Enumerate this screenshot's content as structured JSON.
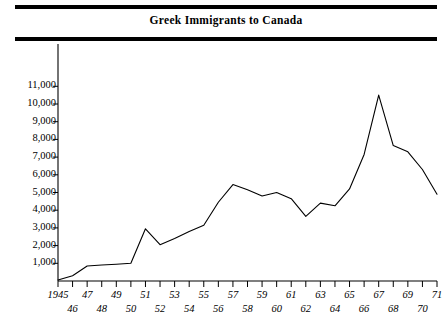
{
  "title": "Greek Immigrants to Canada",
  "chart_data": {
    "type": "line",
    "title": "Greek Immigrants to Canada",
    "xlabel": "",
    "ylabel": "",
    "xlim": [
      1945,
      1971
    ],
    "ylim": [
      0,
      11500
    ],
    "grid": false,
    "legend": null,
    "y_ticks": [
      1000,
      2000,
      3000,
      4000,
      5000,
      6000,
      7000,
      8000,
      9000,
      10000,
      11000
    ],
    "y_tick_labels": [
      "1,000",
      "2,000",
      "3,000",
      "4,000",
      "5,000",
      "6,000",
      "7,000",
      "8,000",
      "9,000",
      "10,000",
      "11,000"
    ],
    "x_ticks": [
      1945,
      1946,
      1947,
      1948,
      1949,
      1950,
      1951,
      1952,
      1953,
      1954,
      1955,
      1956,
      1957,
      1958,
      1959,
      1960,
      1961,
      1962,
      1963,
      1964,
      1965,
      1966,
      1967,
      1968,
      1969,
      1970,
      1971
    ],
    "x_tick_labels_upper": [
      "1945",
      "47",
      "49",
      "51",
      "53",
      "55",
      "57",
      "59",
      "61",
      "63",
      "65",
      "67",
      "69",
      "71"
    ],
    "x_tick_labels_lower": [
      "46",
      "48",
      "50",
      "52",
      "54",
      "56",
      "58",
      "60",
      "62",
      "64",
      "66",
      "68",
      "70"
    ],
    "series": [
      {
        "name": "Greek immigrants to Canada",
        "x": [
          1945,
          1946,
          1947,
          1948,
          1949,
          1950,
          1951,
          1952,
          1953,
          1954,
          1955,
          1956,
          1957,
          1958,
          1959,
          1960,
          1961,
          1962,
          1963,
          1964,
          1965,
          1966,
          1967,
          1968,
          1969,
          1970,
          1971
        ],
        "values": [
          60,
          300,
          850,
          900,
          950,
          1000,
          2950,
          2050,
          2400,
          2800,
          3150,
          4450,
          5450,
          5150,
          4800,
          5000,
          4650,
          3650,
          4400,
          4250,
          5200,
          7150,
          10500,
          7650,
          7300,
          6300,
          4900
        ]
      }
    ],
    "line_color": "#000000",
    "line_width": 1.1,
    "frame_rules": [
      "top",
      "below-title"
    ]
  }
}
